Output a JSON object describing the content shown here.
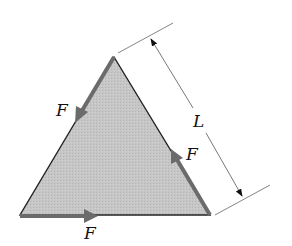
{
  "figure": {
    "shape": "equilateral triangle",
    "fill_color": "#c4c4c4",
    "edge_color": "#222222",
    "force_color": "#6b6b6b",
    "dimension_color": "#555555"
  },
  "labels": {
    "force_left": "F",
    "force_right": "F",
    "force_bottom": "F",
    "side_length": "L"
  },
  "forces": [
    {
      "edge": "left",
      "direction": "down-left along edge (apex to bottom-left)",
      "label": "F"
    },
    {
      "edge": "right",
      "direction": "up along edge (bottom-right to apex)",
      "label": "F"
    },
    {
      "edge": "bottom",
      "direction": "right along edge (bottom-left to bottom-right)",
      "label": "F"
    }
  ],
  "dimension": {
    "label": "L",
    "measures": "right side length of triangle"
  }
}
